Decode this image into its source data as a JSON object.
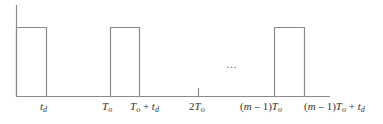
{
  "diagram": {
    "type": "pulse-train",
    "colors": {
      "line": "#8a8a8a",
      "text": "#333333"
    },
    "axis": {
      "x0": 16,
      "y_top": 5,
      "y_base": 96,
      "x_end": 330
    },
    "pulse_top_y": 27,
    "pulses": [
      {
        "x_start": 17,
        "x_end": 46
      },
      {
        "x_start": 110,
        "x_end": 139
      },
      {
        "x_start": 274,
        "x_end": 304
      }
    ],
    "tick": {
      "x": 198,
      "y_top": 88
    },
    "ellipsis": "…",
    "labels": {
      "td": {
        "main": "t",
        "sub": "d"
      },
      "To": {
        "main": "T",
        "sub": "o"
      },
      "To_plus_td": {
        "a": "T",
        "a_sub": "o",
        "plus": " + ",
        "b": "t",
        "b_sub": "d"
      },
      "two_To": {
        "coef": "2",
        "main": "T",
        "sub": "o"
      },
      "m1_To": {
        "pre": "(",
        "m": "m",
        "rest": " – 1)",
        "main": "T",
        "sub": "o"
      },
      "m1_To_plus_td": {
        "pre": "(",
        "m": "m",
        "rest": " – 1)",
        "main": "T",
        "sub": "o",
        "plus": " + ",
        "b": "t",
        "b_sub": "d"
      }
    }
  }
}
